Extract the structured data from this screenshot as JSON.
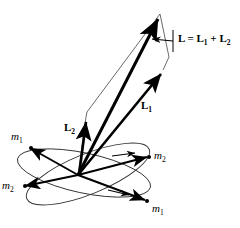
{
  "figure": {
    "background_color": "#ffffff",
    "stroke_color": "#000000",
    "thin_stroke_color": "#3a3a3a",
    "width": 240,
    "height": 228
  },
  "labels": {
    "resultant": {
      "name": "L = L1 + L2",
      "L": "L",
      "equals": " = ",
      "L1_base": "L",
      "L1_sub": "1",
      "plus": " + ",
      "L2_base": "L",
      "L2_sub": "2"
    },
    "vector_l1": {
      "base": "L",
      "sub": "1"
    },
    "vector_l2": {
      "base": "L",
      "sub": "2"
    },
    "mass_upper_left": {
      "base": "m",
      "sub": "1"
    },
    "mass_lower_left": {
      "base": "m",
      "sub": "2"
    },
    "mass_right": {
      "base": "m",
      "sub": "2"
    },
    "mass_bottom": {
      "base": "m",
      "sub": "1"
    }
  },
  "geometry": {
    "origin": {
      "x": 78,
      "y": 175
    },
    "vector_L_tip": {
      "x": 160,
      "y": 14
    },
    "vector_L1_tip": {
      "x": 163,
      "y": 70
    },
    "vector_L2_tip": {
      "x": 86,
      "y": 117
    },
    "parallelogram_apex": {
      "x": 168,
      "y": 57
    },
    "leader_arrow": {
      "from": {
        "x": 175,
        "y": 42
      },
      "to": {
        "x": 150,
        "y": 40
      }
    },
    "orbit_1": {
      "center": {
        "x": 88,
        "y": 174
      },
      "rx": 66,
      "ry": 20,
      "rotation": -22,
      "mass_marker_a": {
        "x": 24,
        "y": 146
      },
      "mass_marker_b": {
        "x": 149,
        "y": 202
      }
    },
    "orbit_2": {
      "center": {
        "x": 84,
        "y": 173
      },
      "rx": 68,
      "ry": 20,
      "rotation": 12,
      "mass_marker_a": {
        "x": 152,
        "y": 155
      },
      "mass_marker_b": {
        "x": 18,
        "y": 187
      }
    }
  }
}
